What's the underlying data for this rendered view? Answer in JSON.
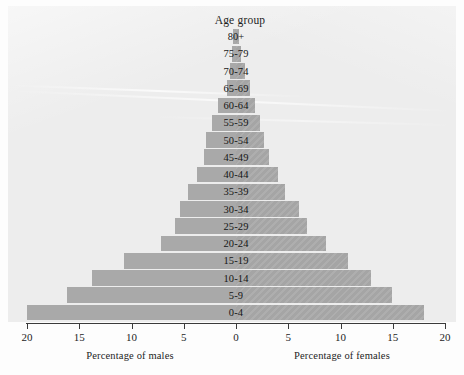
{
  "chart_data": {
    "type": "bar",
    "subtype": "population-pyramid",
    "title": "Age group",
    "xlabel_left": "Percentage of males",
    "xlabel_right": "Percentage of females",
    "ylabel": "Age group",
    "grid": false,
    "legend": "none",
    "axis_ticks": [
      20,
      15,
      10,
      5,
      0,
      5,
      10,
      15,
      20
    ],
    "axis_tick_labels": [
      "20",
      "15",
      "10",
      "5",
      "0",
      "5",
      "10",
      "15",
      "20"
    ],
    "xlim": [
      -20,
      20
    ],
    "categories": [
      "80+",
      "75-79",
      "70-74",
      "65-69",
      "60-64",
      "55-59",
      "50-54",
      "45-49",
      "40-44",
      "35-39",
      "30-34",
      "25-29",
      "20-24",
      "15-19",
      "10-14",
      "5-9",
      "0-4"
    ],
    "series": [
      {
        "name": "Percentage of males",
        "values": [
          0.3,
          0.4,
          0.6,
          0.9,
          1.7,
          2.3,
          2.9,
          3.1,
          3.7,
          4.6,
          5.4,
          5.8,
          7.2,
          10.7,
          13.8,
          16.2,
          20.0
        ]
      },
      {
        "name": "Percentage of females",
        "values": [
          0.3,
          0.5,
          0.9,
          1.3,
          1.8,
          2.3,
          2.7,
          3.2,
          4.0,
          4.7,
          6.0,
          6.8,
          8.6,
          10.7,
          12.9,
          14.9,
          18.0
        ]
      }
    ]
  },
  "colors": {
    "bar": "#a9a9a9",
    "plot_background": "#ededed",
    "page_background": "#fdfdfd",
    "axis": "#3b3b3b",
    "text": "#1d1d1d"
  }
}
